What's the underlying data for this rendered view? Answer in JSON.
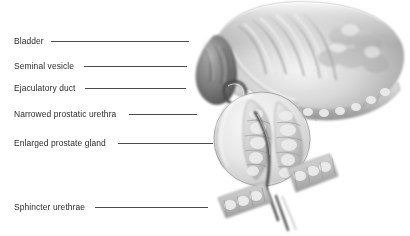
{
  "figure": {
    "background_color": "#ffffff",
    "ink_color": "#2b2b2b",
    "leader_color": "#4a4a4a",
    "width": 410,
    "height": 236
  },
  "labels": [
    {
      "id": "bladder",
      "text": "Bladder",
      "text_x": 14,
      "text_y": 34,
      "rule_width": 138,
      "target_x": 232,
      "target_y": 41
    },
    {
      "id": "seminal-vesicle",
      "text": "Seminal vesicle",
      "text_x": 14,
      "text_y": 59,
      "rule_width": 103,
      "target_x": 215,
      "target_y": 66
    },
    {
      "id": "ejaculatory-duct",
      "text": "Ejaculatory duct",
      "text_x": 14,
      "text_y": 81,
      "rule_width": 101,
      "target_x": 224,
      "target_y": 88
    },
    {
      "id": "narrowed-prostatic-urethra",
      "text": "Narrowed prostatic urethra",
      "text_x": 14,
      "text_y": 107,
      "rule_width": 68,
      "target_x": 253,
      "target_y": 114
    },
    {
      "id": "enlarged-prostate-gland",
      "text": "Enlarged prostate gland",
      "text_x": 14,
      "text_y": 136,
      "rule_width": 95,
      "target_x": 244,
      "target_y": 143
    },
    {
      "id": "sphincter-urethrae",
      "text": "Sphincter urethrae",
      "text_x": 14,
      "text_y": 200,
      "rule_width": 113,
      "target_x": 232,
      "target_y": 207
    }
  ],
  "anatomy": {
    "bladder": {
      "name": "bladder",
      "description": "Large dome-shaped organ filling the upper right, cut open to show interior rugae folds; soft airbrushed grayscale with edges fading into white.",
      "fill_light": "#e8e8e8",
      "fill_mid": "#b9b9b9",
      "fill_dark": "#8a8a8a"
    },
    "bladder_wall_band": {
      "name": "bladder-muscular-wall",
      "description": "Beaded detrusor muscle band running along the lower contour of the bladder.",
      "fill": "#c9c9c9"
    },
    "seminal_vesicle": {
      "name": "seminal-vesicle",
      "description": "Dark lobulated teardrop structure on the left, posterior to the bladder.",
      "fill_light": "#9a9a9a",
      "fill_dark": "#5d5d5d"
    },
    "ejaculatory_duct": {
      "name": "ejaculatory-duct",
      "description": "Small dark ring/loop where the duct enters the prostate below the seminal vesicle.",
      "fill": "#4f4f4f"
    },
    "prostate_gland": {
      "name": "enlarged-prostate-gland",
      "description": "Large pale ovoid gland, enlarged, containing two hyperplastic lobes of nodular tissue.",
      "fill_light": "#f0f0f0",
      "fill_mid": "#d2d2d2",
      "outline": "#8f8f8f"
    },
    "hyperplastic_lobes": {
      "name": "hyperplastic-nodular-tissue",
      "description": "Cobblestoned nodular lobes inside the prostate compressing the urethra from both sides.",
      "fill": "#c4c4c4"
    },
    "prostatic_urethra": {
      "name": "narrowed-prostatic-urethra",
      "description": "Dark slit-like channel squeezed between the two enlarged lobes, continuing downward.",
      "fill": "#3c3c3c"
    },
    "sphincter_urethrae": {
      "name": "sphincter-urethrae",
      "description": "Two diagonal segmented muscular bands below the prostate surrounding the membranous urethra.",
      "fill": "#bdbdbd"
    }
  }
}
